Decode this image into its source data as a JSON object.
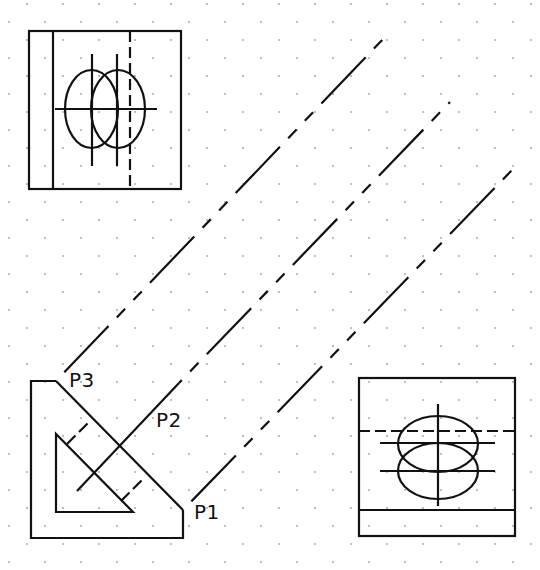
{
  "drawing": {
    "title": "Auxiliary view projection",
    "background": "#ffffff",
    "ink_color": "#111111",
    "grid": {
      "style": "staggered-dots",
      "pitch_px": 36,
      "stagger_px": 18
    }
  },
  "labels": {
    "p1": "P1",
    "p2": "P2",
    "p3": "P3"
  },
  "views": {
    "top_left_view": {
      "name": "front-view",
      "features": [
        "two-overlapping-ellipses",
        "center-line",
        "hidden-line"
      ]
    },
    "bottom_right_view": {
      "name": "auxiliary-view",
      "features": [
        "two-overlapping-ellipses",
        "center-line",
        "hidden-line"
      ]
    },
    "bottom_left_view": {
      "name": "top-view",
      "features": [
        "triangular-cutout",
        "projection-ticks"
      ]
    }
  },
  "projection_lines": [
    {
      "from": "P3",
      "linetype": "phantom"
    },
    {
      "from": "P2",
      "linetype": "phantom"
    },
    {
      "from": "P1",
      "linetype": "phantom"
    }
  ]
}
